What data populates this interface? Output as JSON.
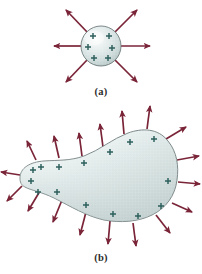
{
  "figure": {
    "background_color": "#ffffff"
  },
  "palette": {
    "arrow_color": "#7a2438",
    "arrow_dark": "#5d1b2c",
    "charge_color": "#2c5f5c",
    "body_fill_light": "#fdfdfd",
    "body_fill_mid": "#d5e0e0",
    "body_fill_dark": "#b9c9c9",
    "outline_color": "#6e7b7b",
    "caption_color": "#2b2b2b"
  },
  "panels": [
    {
      "id": "a",
      "caption": "(a)",
      "shape": "sphere",
      "shape_name": "charged-sphere",
      "center": {
        "x": 101,
        "y": 46
      },
      "radius": 20,
      "charge_symbol": "+",
      "charge_count": 6,
      "charges": [
        {
          "x": 93,
          "y": 36
        },
        {
          "x": 109,
          "y": 36
        },
        {
          "x": 88,
          "y": 47
        },
        {
          "x": 112,
          "y": 48
        },
        {
          "x": 94,
          "y": 58
        },
        {
          "x": 108,
          "y": 58
        }
      ],
      "field_arrow_count": 6,
      "field_arrows": [
        {
          "angle_deg": 180,
          "length": 31,
          "label": "left"
        },
        {
          "angle_deg": 0,
          "length": 31,
          "label": "right"
        },
        {
          "angle_deg": 233,
          "length": 31,
          "label": "upper-left"
        },
        {
          "angle_deg": 307,
          "length": 31,
          "label": "upper-right"
        },
        {
          "angle_deg": 127,
          "length": 31,
          "label": "lower-left"
        },
        {
          "angle_deg": 53,
          "length": 31,
          "label": "lower-right"
        }
      ]
    },
    {
      "id": "b",
      "caption": "(b)",
      "shape": "irregular-blob",
      "shape_name": "charged-irregular-conductor",
      "charge_symbol": "+",
      "charge_count": 15,
      "charges": [
        {
          "x": 33,
          "y": 170
        },
        {
          "x": 31,
          "y": 182
        },
        {
          "x": 38,
          "y": 192
        },
        {
          "x": 41,
          "y": 168
        },
        {
          "x": 59,
          "y": 167
        },
        {
          "x": 57,
          "y": 192
        },
        {
          "x": 84,
          "y": 163
        },
        {
          "x": 86,
          "y": 206
        },
        {
          "x": 110,
          "y": 153
        },
        {
          "x": 113,
          "y": 215
        },
        {
          "x": 130,
          "y": 142
        },
        {
          "x": 138,
          "y": 217
        },
        {
          "x": 154,
          "y": 139
        },
        {
          "x": 168,
          "y": 181
        },
        {
          "x": 161,
          "y": 206
        }
      ],
      "field_arrow_count": 18,
      "outline_points": [
        {
          "x": 20,
          "y": 178
        },
        {
          "x": 26,
          "y": 165
        },
        {
          "x": 42,
          "y": 161
        },
        {
          "x": 70,
          "y": 160
        },
        {
          "x": 100,
          "y": 149
        },
        {
          "x": 125,
          "y": 134
        },
        {
          "x": 148,
          "y": 130
        },
        {
          "x": 168,
          "y": 141
        },
        {
          "x": 178,
          "y": 163
        },
        {
          "x": 176,
          "y": 193
        },
        {
          "x": 160,
          "y": 213
        },
        {
          "x": 133,
          "y": 224
        },
        {
          "x": 105,
          "y": 221
        },
        {
          "x": 72,
          "y": 205
        },
        {
          "x": 45,
          "y": 193
        },
        {
          "x": 27,
          "y": 188
        }
      ]
    }
  ]
}
